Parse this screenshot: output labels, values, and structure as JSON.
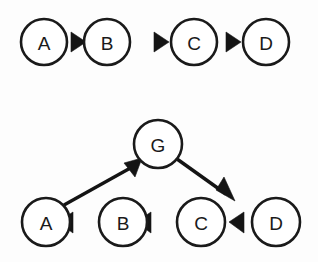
{
  "figure": {
    "background_color": "#fdfdfd",
    "stroke_color": "#1a1a1a",
    "fill_color": "#ffffff",
    "width": 318,
    "height": 262
  },
  "diagrams": [
    {
      "id": "top-chain",
      "description": "Linear chain A to B to C to D",
      "nodes": [
        {
          "id": "top-a",
          "label": "A",
          "cx": 44,
          "cy": 42,
          "r": 23
        },
        {
          "id": "top-b",
          "label": "B",
          "cx": 107,
          "cy": 42,
          "r": 23
        },
        {
          "id": "top-c",
          "label": "C",
          "cx": 194,
          "cy": 42,
          "r": 23
        },
        {
          "id": "top-d",
          "label": "D",
          "cx": 266,
          "cy": 42,
          "r": 23
        }
      ],
      "edges": [
        {
          "id": "top-a-b",
          "from": "A",
          "to": "B",
          "kind": "arrowhead-only",
          "direction": "right",
          "tip_x": 85,
          "tip_y": 42
        },
        {
          "id": "top-b-c",
          "from": "B",
          "to": "C",
          "kind": "arrowhead-only",
          "direction": "right",
          "tip_x": 168,
          "tip_y": 42
        },
        {
          "id": "top-c-d",
          "from": "C",
          "to": "D",
          "kind": "arrowhead-only",
          "direction": "right",
          "tip_x": 240,
          "tip_y": 42
        }
      ]
    },
    {
      "id": "bottom-graph",
      "description": "Row A B C D with left arrows, plus node G above with arrows A to G and G to D",
      "nodes": [
        {
          "id": "bot-g",
          "label": "G",
          "cx": 158,
          "cy": 144,
          "r": 24
        },
        {
          "id": "bot-a",
          "label": "A",
          "cx": 46,
          "cy": 222,
          "r": 24
        },
        {
          "id": "bot-b",
          "label": "B",
          "cx": 123,
          "cy": 222,
          "r": 24
        },
        {
          "id": "bot-c",
          "label": "C",
          "cx": 201,
          "cy": 222,
          "r": 24
        },
        {
          "id": "bot-d",
          "label": "D",
          "cx": 276,
          "cy": 222,
          "r": 24
        }
      ],
      "edges": [
        {
          "id": "bot-b-a",
          "from": "B",
          "to": "A",
          "kind": "arrowhead-only",
          "direction": "left",
          "tip_x": 73,
          "tip_y": 222
        },
        {
          "id": "bot-c-b",
          "from": "C",
          "to": "B",
          "kind": "arrowhead-only",
          "direction": "left",
          "tip_x": 151,
          "tip_y": 222
        },
        {
          "id": "bot-d-c",
          "from": "D",
          "to": "C",
          "kind": "arrowhead-only",
          "direction": "left",
          "tip_x": 228,
          "tip_y": 222
        },
        {
          "id": "bot-a-g",
          "from": "A",
          "to": "G",
          "kind": "line-with-arrow",
          "direction": "up-right",
          "x1": 64,
          "y1": 204,
          "x2": 132,
          "y2": 164
        },
        {
          "id": "bot-g-d",
          "from": "G",
          "to": "D",
          "kind": "line-with-arrow",
          "direction": "down-right",
          "x1": 178,
          "y1": 160,
          "x2": 233,
          "y2": 200
        }
      ]
    }
  ]
}
